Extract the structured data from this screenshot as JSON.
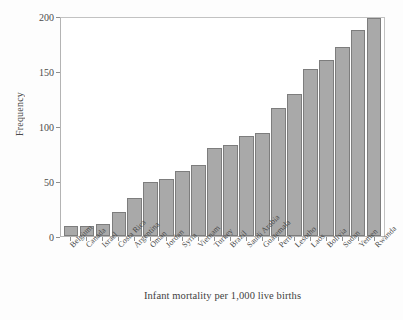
{
  "chart_data": {
    "type": "bar",
    "title": "",
    "xlabel": "Infant mortality per 1,000 live births",
    "ylabel": "Frequency",
    "categories": [
      "Belgium",
      "Canada",
      "Israel",
      "Costa Rica",
      "Argentina",
      "Oman",
      "Jordan",
      "Syria",
      "Vietnam",
      "Turkey",
      "Brazil",
      "Saudi Arabia",
      "Guatemala",
      "Peru",
      "Lesotho",
      "Laos",
      "Bolivia",
      "Sudan",
      "Yemen",
      "Rwanda"
    ],
    "values": [
      9,
      9,
      11,
      22,
      35,
      49,
      52,
      59,
      65,
      80,
      83,
      91,
      94,
      116,
      129,
      152,
      160,
      172,
      187,
      198
    ],
    "ylim": [
      0,
      200
    ],
    "yticks": [
      0,
      50,
      100,
      150,
      200
    ],
    "ytick_labels": [
      "0",
      "50",
      "100",
      "150",
      "200"
    ],
    "grid": false,
    "legend": false,
    "bar_color": "#a9a9a9",
    "bar_border_color": "#7d7d7d",
    "frame_color": "#b4b4b4",
    "text_color": "#4a4a4a"
  }
}
